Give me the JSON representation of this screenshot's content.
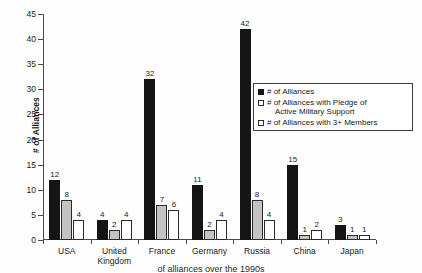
{
  "chart_data": {
    "type": "bar",
    "title": "",
    "xlabel": "",
    "ylabel": "# of Alliances",
    "ylim": [
      0,
      45
    ],
    "ytick_step": 5,
    "yticks": [
      0,
      5,
      10,
      15,
      20,
      25,
      30,
      35,
      40,
      45
    ],
    "grid": false,
    "legend_position": "inside upper-right",
    "categories": [
      "USA",
      "United Kingdom",
      "France",
      "Germany",
      "Russia",
      "China",
      "Japan"
    ],
    "series": [
      {
        "name": "# of Alliances",
        "color": "#151515",
        "values": [
          12,
          4,
          32,
          11,
          42,
          15,
          3
        ]
      },
      {
        "name": "# of Alliances with Pledge of Active Military Support",
        "color": "#c3c3c3",
        "values": [
          8,
          2,
          7,
          2,
          8,
          1,
          1
        ]
      },
      {
        "name": "# of Alliances with 3+ Members",
        "color": "#ffffff",
        "values": [
          4,
          4,
          6,
          4,
          4,
          2,
          1
        ]
      }
    ],
    "legend": [
      {
        "label": "# of Alliances",
        "label_line2": ""
      },
      {
        "label": "# of Alliances with Pledge of",
        "label_line2": "Active Military Support"
      },
      {
        "label": "# of Alliances with 3+ Members",
        "label_line2": ""
      }
    ]
  },
  "caption": "of alliances over the 1990s"
}
